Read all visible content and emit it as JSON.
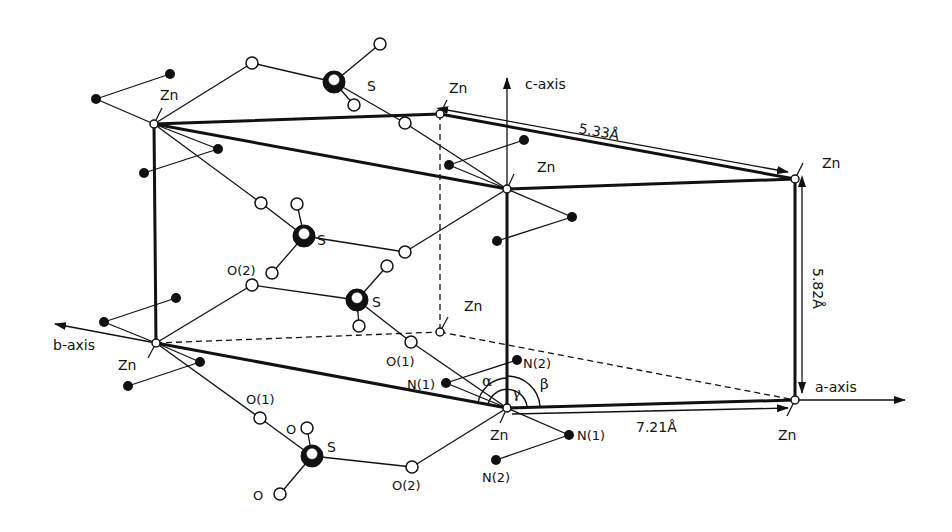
{
  "figure": {
    "type": "crystal-structure"
  },
  "axes": {
    "a": {
      "label": "a-axis"
    },
    "b": {
      "label": "b-axis"
    },
    "c": {
      "label": "c-axis"
    }
  },
  "dimensions": {
    "a_length": "7.21Å",
    "b_length": "5.33Å",
    "c_length": "5.82Å"
  },
  "angles": {
    "alpha": "α",
    "beta": "β",
    "gamma": "γ"
  },
  "atom_labels": {
    "zn": "Zn",
    "s": "S",
    "o": "O",
    "o1": "O(1)",
    "o2": "O(2)",
    "n1": "N(1)",
    "n2": "N(2)"
  },
  "colors": {
    "line": "#111111",
    "background": "#ffffff",
    "open_atom": "#ffffff",
    "filled_atom": "#111111"
  }
}
